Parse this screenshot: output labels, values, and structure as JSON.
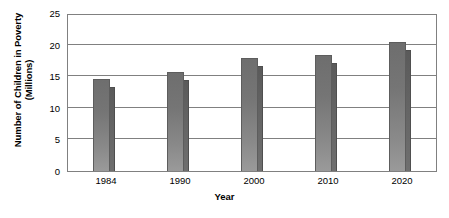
{
  "chart_data": {
    "type": "bar",
    "title": "",
    "subtitle": "",
    "xlabel": "Year",
    "ylabel": "Number of Children in Poverty (Millions)",
    "ylabel_line1": "Number of Children in Poverty",
    "ylabel_line2": "(Millions)",
    "categories": [
      "1984",
      "1990",
      "2000",
      "2010",
      "2020"
    ],
    "ylim": [
      0,
      25
    ],
    "yticks": [
      0,
      5,
      10,
      15,
      20,
      25
    ],
    "ytick_labels": [
      "0",
      "5",
      "10",
      "15",
      "20",
      "25"
    ],
    "grid": true,
    "grid_axis": "y",
    "legend": false,
    "legend_position": "none",
    "series": [
      {
        "name": "front",
        "color": "#757575",
        "values": [
          14.6,
          15.7,
          17.9,
          18.4,
          20.4
        ]
      },
      {
        "name": "back",
        "color": "#636363",
        "values": [
          13.3,
          14.4,
          16.6,
          17.1,
          19.2
        ]
      }
    ]
  },
  "axes": {
    "y_title_line1": "Number of Children in Poverty",
    "y_title_line2": "(Millions)",
    "x_title": "Year"
  }
}
